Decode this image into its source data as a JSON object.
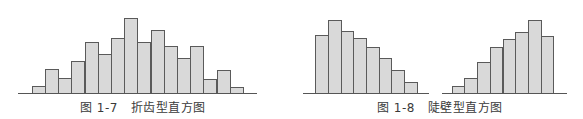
{
  "colors": {
    "bar_fill": "#d9d9d9",
    "bar_stroke": "#5a5a5a",
    "axis": "#555555",
    "caption": "#3a3a3a"
  },
  "figures": [
    {
      "id": "fig-1-7",
      "caption": "图 1-7   折齿型直方图",
      "caption_x": 80
    },
    {
      "id": "fig-1-8",
      "caption": "图 1-8   陡壁型直方图",
      "caption_x": 377
    }
  ],
  "chart_data": [
    {
      "type": "bar",
      "title": "图 1-7 折齿型直方图",
      "xlabel": "",
      "ylabel": "",
      "grid": false,
      "categories": [
        "1",
        "2",
        "3",
        "4",
        "5",
        "6",
        "7",
        "8",
        "9",
        "10",
        "11",
        "12",
        "13",
        "14",
        "15",
        "16"
      ],
      "values": [
        7,
        24,
        15,
        32,
        51,
        39,
        55,
        75,
        51,
        63,
        47,
        35,
        47,
        14,
        23,
        6
      ],
      "layout": {
        "x0": 31.7,
        "bar_width": 13.2,
        "baseline_y": 92.7,
        "axis_from": 18,
        "axis_to": 257
      }
    },
    {
      "type": "bar",
      "title": "图 1-8 陡壁型直方图 (left)",
      "xlabel": "",
      "ylabel": "",
      "grid": false,
      "categories": [
        "1",
        "2",
        "3",
        "4",
        "5",
        "6",
        "7",
        "8"
      ],
      "values": [
        58,
        73,
        62,
        55,
        46,
        35,
        23,
        11
      ],
      "layout": {
        "x0": 315.3,
        "bar_width": 12.67,
        "baseline_y": 93.3,
        "axis_from": 303,
        "axis_to": 429
      }
    },
    {
      "type": "bar",
      "title": "图 1-8 陡壁型直方图 (right)",
      "xlabel": "",
      "ylabel": "",
      "grid": false,
      "categories": [
        "1",
        "2",
        "3",
        "4",
        "5",
        "6",
        "7",
        "8"
      ],
      "values": [
        7,
        15,
        31,
        46,
        54,
        61,
        73,
        57
      ],
      "layout": {
        "x0": 451.7,
        "bar_width": 12.7,
        "baseline_y": 93.3,
        "axis_from": 442,
        "axis_to": 567
      }
    }
  ]
}
